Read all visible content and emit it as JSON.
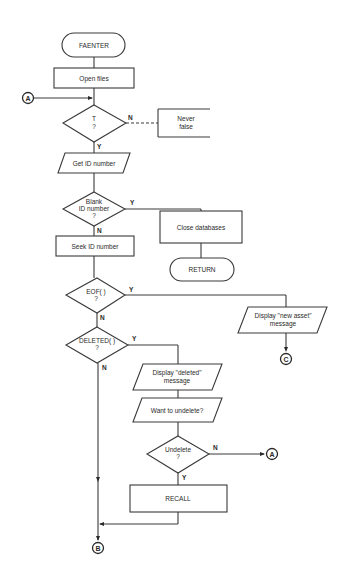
{
  "diagram": {
    "type": "flowchart",
    "nodes": {
      "start": {
        "kind": "terminal",
        "label": "FAENTER"
      },
      "open_files": {
        "kind": "process",
        "label": "Open files"
      },
      "cond_t": {
        "kind": "decision",
        "line1": "T",
        "line2": "?"
      },
      "never_false": {
        "kind": "annotation",
        "line1": "Never",
        "line2": "false"
      },
      "get_id": {
        "kind": "io",
        "label": "Get ID number"
      },
      "blank_id": {
        "kind": "decision",
        "line1": "Blank",
        "line2": "ID number",
        "line3": "?"
      },
      "close_db": {
        "kind": "process",
        "label": "Close databases"
      },
      "return": {
        "kind": "terminal",
        "label": "RETURN"
      },
      "seek_id": {
        "kind": "process",
        "label": "Seek ID number"
      },
      "eof": {
        "kind": "decision",
        "line1": "EOF( )",
        "line2": "?"
      },
      "new_asset": {
        "kind": "io",
        "line1": "Display \"new asset\"",
        "line2": "message"
      },
      "deleted": {
        "kind": "decision",
        "line1": "DELETED( )",
        "line2": "?"
      },
      "disp_deleted": {
        "kind": "io",
        "line1": "Display \"deleted\"",
        "line2": "message"
      },
      "want_undelete": {
        "kind": "io",
        "label": "Want to undelete?"
      },
      "undelete": {
        "kind": "decision",
        "line1": "Undelete",
        "line2": "?"
      },
      "recall": {
        "kind": "process",
        "label": "RECALL"
      }
    },
    "connectors": {
      "a_in": "A",
      "a_out": "A",
      "b_out": "B",
      "c_out": "C"
    },
    "branch_labels": {
      "yes": "Y",
      "no": "N"
    }
  }
}
